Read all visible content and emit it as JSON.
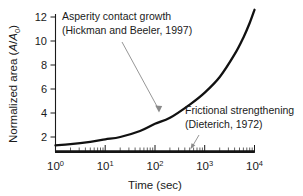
{
  "chart_data": {
    "type": "line",
    "title": "",
    "xlabel": "Time (sec)",
    "ylabel": "Normalized area (A/A0)",
    "ylabel_parts": {
      "prefix": "Normalized area (",
      "italic_a": "A",
      "slash": "/",
      "italic_a2": "A",
      "subscript": "0",
      "suffix": ")"
    },
    "xscale": "log",
    "yscale": "linear",
    "xlim": [
      1,
      10000
    ],
    "ylim": [
      0.45,
      13.0
    ],
    "grid": false,
    "legend": "none",
    "x_tick_labels": [
      "10^0",
      "10^1",
      "10^2",
      "10^3",
      "10^4"
    ],
    "x_tick_mantissa": [
      "10",
      "10",
      "10",
      "10",
      "10"
    ],
    "x_tick_exponents": [
      "0",
      "1",
      "2",
      "3",
      "4"
    ],
    "x_tick_values": [
      1,
      10,
      100,
      1000,
      10000
    ],
    "y_tick_labels": [
      "2",
      "4",
      "6",
      "8",
      "10",
      "12"
    ],
    "y_tick_values": [
      2,
      4,
      6,
      8,
      10,
      12
    ],
    "series": [
      {
        "name": "Asperity contact growth",
        "reference": "(Hickman and Beeler, 1997)",
        "x": [
          1,
          2,
          5,
          10,
          20,
          50,
          100,
          200,
          500,
          1000,
          2000,
          4000,
          6000,
          8000,
          10000
        ],
        "y": [
          1.3,
          1.4,
          1.6,
          1.8,
          2.0,
          2.5,
          3.1,
          3.6,
          4.7,
          5.7,
          7.0,
          8.9,
          10.3,
          11.5,
          12.6
        ],
        "style": "solid-thick-black"
      },
      {
        "name": "Frictional strengthening",
        "reference": "(Dieterich, 1972)",
        "x": [
          1,
          10,
          100,
          1000,
          10000
        ],
        "y": [
          0.78,
          0.78,
          0.78,
          0.78,
          0.78
        ],
        "style": "solid-thick-black-flat"
      }
    ],
    "annotations": [
      {
        "id": "asperity",
        "line1": "Asperity contact growth",
        "line2": "(Hickman and Beeler, 1997)",
        "points_to_x": 100,
        "points_to_y": 3.1
      },
      {
        "id": "frictional",
        "line1": "Frictional strengthening",
        "line2": "(Dieterich, 1972)",
        "points_to_x": 1000,
        "points_to_y": 0.78
      }
    ],
    "colors": {
      "curve": "#111111",
      "axis": "#1a1a1a",
      "leader": "#8a8a8a",
      "background": "#ffffff"
    }
  }
}
